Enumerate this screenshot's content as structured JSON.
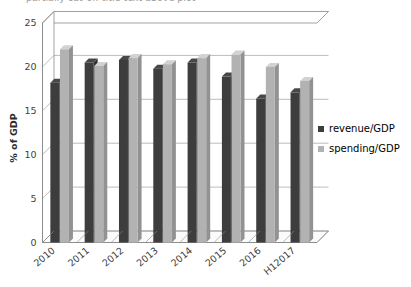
{
  "chart_data": {
    "type": "bar",
    "title": "",
    "xlabel": "",
    "ylabel": "% of GDP",
    "ylim": [
      0,
      25
    ],
    "yticks": [
      0,
      5,
      10,
      15,
      20,
      25
    ],
    "ytick_labels": [
      "0",
      "5",
      "10",
      "15",
      "20",
      "25"
    ],
    "grid": true,
    "legend_position": "right",
    "style": "3d-clustered-column",
    "categories": [
      "2010",
      "2011",
      "2012",
      "2013",
      "2014",
      "2015",
      "2016",
      "H12017"
    ],
    "series": [
      {
        "name": "revenue/GDP",
        "color": "#3d3d3d",
        "values": [
          18.2,
          20.5,
          20.8,
          19.8,
          20.5,
          18.9,
          16.4,
          17.1
        ]
      },
      {
        "name": "spending/GDP",
        "color": "#b2b2b2",
        "values": [
          22.0,
          20.1,
          21.0,
          20.3,
          21.0,
          21.4,
          20.0,
          18.4
        ]
      }
    ]
  },
  "axis": {
    "y_title": "% of GDP"
  },
  "legend": {
    "items": [
      {
        "label": "revenue/GDP",
        "color": "#3d3d3d"
      },
      {
        "label": "spending/GDP",
        "color": "#b2b2b2"
      }
    ]
  },
  "colors": {
    "revenue": "#3d3d3d",
    "spending": "#b2b2b2",
    "gridline": "#9f9f9f",
    "axis": "#8a8a8a",
    "text": "#3f3f3f",
    "background": "#ffffff"
  },
  "cropped_title_fragment": "partially cut-off title text above plot"
}
